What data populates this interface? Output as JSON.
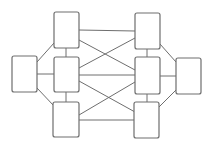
{
  "diagram": {
    "type": "network-graph",
    "stroke_color": "#6e6e6e",
    "background": "#ffffff",
    "nodes": [
      {
        "id": "L",
        "label": "",
        "x": 12,
        "y": 56,
        "w": 25,
        "h": 36
      },
      {
        "id": "LT",
        "label": "",
        "x": 54,
        "y": 12,
        "w": 25,
        "h": 36
      },
      {
        "id": "LM",
        "label": "",
        "x": 54,
        "y": 57,
        "w": 25,
        "h": 35
      },
      {
        "id": "LB",
        "label": "",
        "x": 53,
        "y": 102,
        "w": 26,
        "h": 35
      },
      {
        "id": "RT",
        "label": "",
        "x": 135,
        "y": 13,
        "w": 25,
        "h": 36
      },
      {
        "id": "RM",
        "label": "",
        "x": 135,
        "y": 57,
        "w": 25,
        "h": 37
      },
      {
        "id": "RB",
        "label": "",
        "x": 134,
        "y": 102,
        "w": 25,
        "h": 36
      },
      {
        "id": "R",
        "label": "",
        "x": 176,
        "y": 58,
        "w": 25,
        "h": 36
      }
    ],
    "edges": [
      [
        "L",
        "LT"
      ],
      [
        "L",
        "LM"
      ],
      [
        "L",
        "LB"
      ],
      [
        "LT",
        "LM"
      ],
      [
        "LM",
        "LB"
      ],
      [
        "LT",
        "RT"
      ],
      [
        "LT",
        "RM"
      ],
      [
        "LM",
        "RT"
      ],
      [
        "LM",
        "RM"
      ],
      [
        "LM",
        "RB"
      ],
      [
        "LB",
        "RM"
      ],
      [
        "LB",
        "RB"
      ],
      [
        "RT",
        "RM"
      ],
      [
        "RM",
        "RB"
      ],
      [
        "RT",
        "R"
      ],
      [
        "RM",
        "R"
      ],
      [
        "RB",
        "R"
      ]
    ]
  }
}
